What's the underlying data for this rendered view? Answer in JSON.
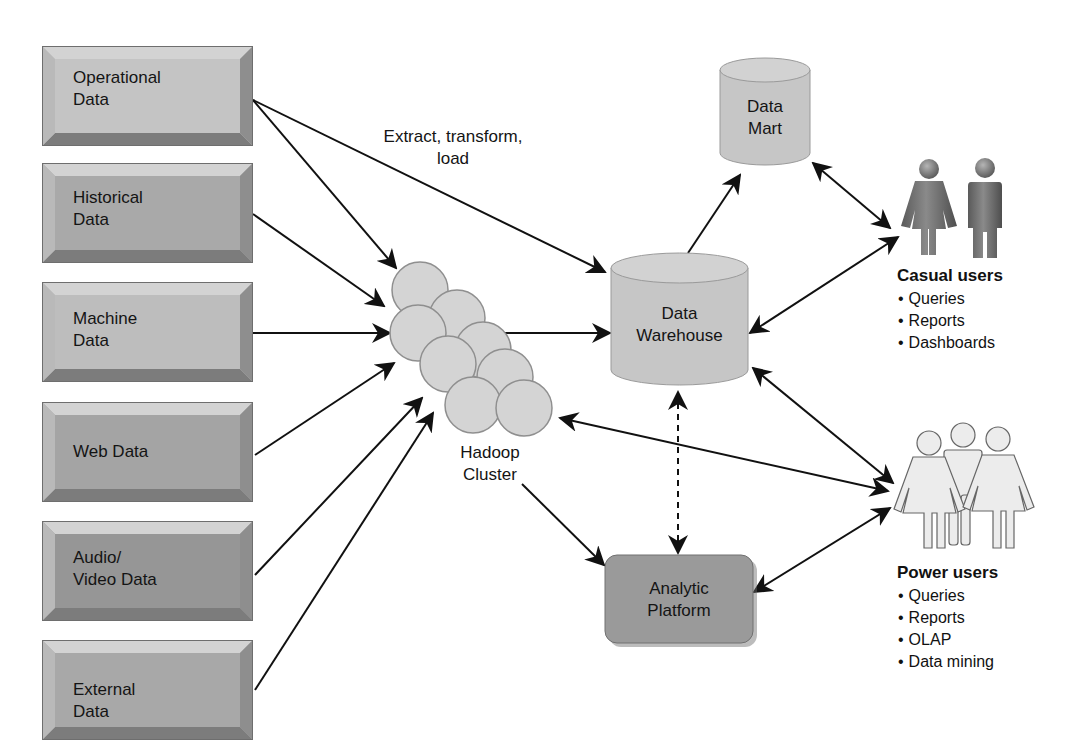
{
  "sources": [
    {
      "label": "Operational\nData",
      "top": 46,
      "shade": "#c4c4c4"
    },
    {
      "label": "Historical\nData",
      "top": 163,
      "shade": "#a9a9a9"
    },
    {
      "label": "Machine\nData",
      "top": 282,
      "shade": "#bdbdbd"
    },
    {
      "label": "Web Data",
      "top": 402,
      "shade": "#a4a4a4"
    },
    {
      "label": "Audio/\nVideo Data",
      "top": 521,
      "shade": "#969696"
    },
    {
      "label": "External\nData",
      "top": 640,
      "shade": "#a8a8a8"
    }
  ],
  "etl_label": "Extract, transform,\nload",
  "hadoop": {
    "label": "Hadoop\nCluster"
  },
  "data_mart": {
    "label": "Data\nMart"
  },
  "data_warehouse": {
    "label": "Data\nWarehouse"
  },
  "analytic_platform": {
    "label": "Analytic\nPlatform"
  },
  "casual_users": {
    "title": "Casual users",
    "items": [
      "Queries",
      "Reports",
      "Dashboards"
    ]
  },
  "power_users": {
    "title": "Power users",
    "items": [
      "Queries",
      "Reports",
      "OLAP",
      "Data mining"
    ]
  },
  "colors": {
    "cylinder_fill": "#c6c6c6",
    "cylinder_top": "#d2d2d2",
    "platform_fill": "#9a9a9a",
    "circle_fill": "#d4d4d4",
    "arrow": "#111111"
  }
}
